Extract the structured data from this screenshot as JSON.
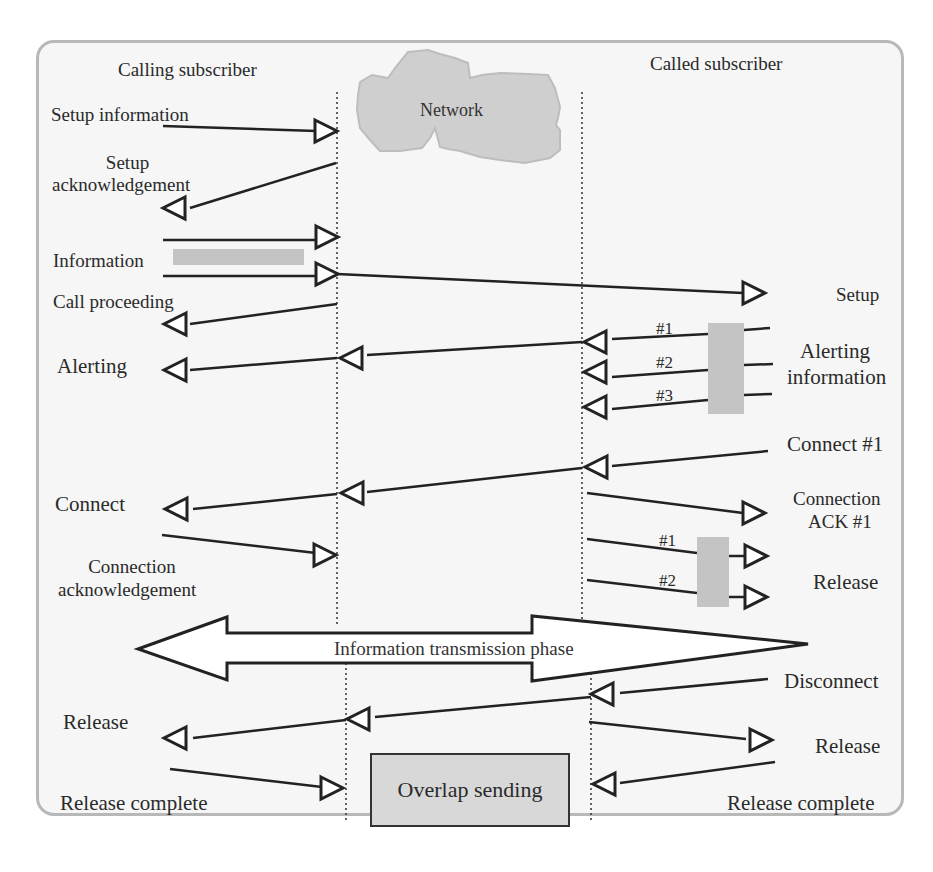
{
  "diagram": {
    "title_left": "Calling subscriber",
    "title_right": "Called subscriber",
    "network_label": "Network",
    "phase_label": "Information transmission phase",
    "overlap_label": "Overlap sending",
    "colors": {
      "frame_border": "#b8b8b8",
      "frame_fill": "#f6f6f6",
      "cloud_fill": "#cfcfcf",
      "shade_fill": "#c4c4c4",
      "line": "#222222"
    },
    "left_labels": {
      "setup_information": "Setup information",
      "setup_ack_1": "Setup",
      "setup_ack_2": "acknowledgement",
      "information": "Information",
      "call_proceeding": "Call proceeding",
      "alerting": "Alerting",
      "connect": "Connect",
      "connection_ack_1": "Connection",
      "connection_ack_2": "acknowledgement",
      "release": "Release",
      "release_complete": "Release complete"
    },
    "right_labels": {
      "setup": "Setup",
      "alerting_info_1": "Alerting",
      "alerting_info_2": "information",
      "connect_1": "Connect #1",
      "connection_ack_1": "Connection",
      "connection_ack_2": "ACK #1",
      "release": "Release",
      "disconnect": "Disconnect",
      "release_2": "Release",
      "release_complete": "Release complete"
    },
    "tags": {
      "alert_1": "#1",
      "alert_2": "#2",
      "alert_3": "#3",
      "rel_1": "#1",
      "rel_2": "#2"
    }
  }
}
